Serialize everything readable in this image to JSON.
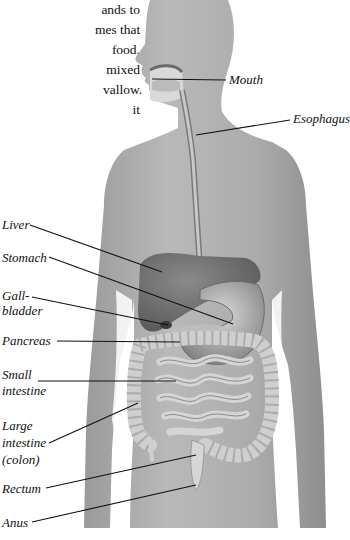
{
  "intro_text_fragments": [
    "ands to",
    "mes that",
    "food.",
    "mixed",
    "vallow.",
    "it"
  ],
  "figure": {
    "type": "anatomical-diagram",
    "labels": {
      "mouth": "Mouth",
      "esophagus": "Esophagus",
      "liver": "Liver",
      "stomach": "Stomach",
      "gallbladder_1": "Gall-",
      "gallbladder_2": "bladder",
      "pancreas": "Pancreas",
      "small_intestine_1": "Small",
      "small_intestine_2": "intestine",
      "large_intestine_1": "Large",
      "large_intestine_2": "intestine",
      "large_intestine_3": "(colon)",
      "rectum": "Rectum",
      "anus": "Anus"
    }
  },
  "colors": {
    "skin": "#a9a9a9",
    "skin_light": "#c4c4c4",
    "organ_dark": "#6f6f6f",
    "organ_light": "#d6d6d6",
    "line": "#111111"
  }
}
